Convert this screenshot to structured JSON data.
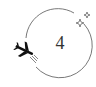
{
  "step": {
    "number": "4"
  },
  "icons": {
    "main": "airplane-icon",
    "decoration": "sparkle-icon"
  },
  "colors": {
    "ring": "#555555",
    "plane": "#111111",
    "number": "#333333",
    "sparkle": "#555555"
  }
}
